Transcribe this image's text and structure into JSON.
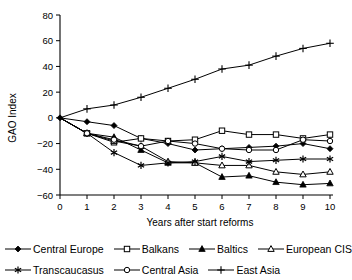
{
  "chart_data": {
    "type": "line",
    "title": "",
    "xlabel": "Years after start reforms",
    "ylabel": "GAO Index",
    "x": [
      0,
      1,
      2,
      3,
      4,
      5,
      6,
      7,
      8,
      9,
      10
    ],
    "xticklabels": [
      "0",
      "1",
      "2",
      "3",
      "4",
      "5",
      "6",
      "7",
      "8",
      "9",
      "10"
    ],
    "yticklabels": [
      "-60",
      "-40",
      "-20",
      "0",
      "20",
      "40",
      "60",
      "80"
    ],
    "yticks": [
      -60,
      -40,
      -20,
      0,
      20,
      40,
      60,
      80
    ],
    "xlim": [
      0,
      10
    ],
    "ylim": [
      -60,
      80
    ],
    "grid": false,
    "legend_position": "below",
    "series": [
      {
        "name": "Central Europe",
        "marker": "filled-diamond",
        "values": [
          0,
          -3,
          -6,
          -16,
          -20,
          -25,
          -24,
          -23,
          -22,
          -20,
          -24
        ]
      },
      {
        "name": "Balkans",
        "marker": "open-square",
        "values": [
          0,
          -12,
          -19,
          -16,
          -18,
          -17,
          -10,
          -13,
          -13,
          -16,
          -13
        ]
      },
      {
        "name": "Baltics",
        "marker": "filled-triangle",
        "values": [
          0,
          -12,
          -15,
          -25,
          -35,
          -35,
          -46,
          -45,
          -50,
          -52,
          -51
        ]
      },
      {
        "name": "European CIS",
        "marker": "open-triangle",
        "values": [
          0,
          -12,
          -18,
          -22,
          -34,
          -35,
          -37,
          -37,
          -42,
          -44,
          -42
        ]
      },
      {
        "name": "Transcaucasus",
        "marker": "asterisk",
        "values": [
          0,
          -12,
          -27,
          -37,
          -35,
          -34,
          -30,
          -34,
          -33,
          -32,
          -32
        ]
      },
      {
        "name": "Central Asia",
        "marker": "open-circle",
        "values": [
          0,
          -12,
          -17,
          -22,
          -18,
          -20,
          -24,
          -25,
          -25,
          -17,
          -18
        ]
      },
      {
        "name": "East Asia",
        "marker": "plus",
        "values": [
          0,
          7,
          10,
          16,
          23,
          30,
          38,
          41,
          48,
          54,
          58
        ]
      }
    ]
  },
  "axes": {
    "y_title": "GAO Index",
    "x_title": "Years after start reforms"
  },
  "legend": {
    "rows": [
      [
        {
          "label": "Central Europe",
          "marker": "filled-diamond"
        },
        {
          "label": "Balkans",
          "marker": "open-square"
        },
        {
          "label": "Baltics",
          "marker": "filled-triangle"
        },
        {
          "label": "European CIS",
          "marker": "open-triangle"
        }
      ],
      [
        {
          "label": "Transcaucasus",
          "marker": "asterisk"
        },
        {
          "label": "Central Asia",
          "marker": "open-circle"
        },
        {
          "label": "East Asia",
          "marker": "plus"
        }
      ]
    ]
  },
  "colors": {
    "line": "#000000",
    "axis": "#000000",
    "background": "#ffffff"
  }
}
